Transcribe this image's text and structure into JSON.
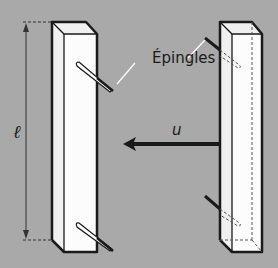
{
  "diagram": {
    "labels": {
      "pins": "Épingles",
      "length": "ℓ",
      "velocity": "u"
    },
    "elements": [
      {
        "name": "left-bar",
        "description": "rectangular bar with two pins stuck through its front face"
      },
      {
        "name": "right-bar",
        "description": "rectangular bar with two pins, hidden parts dashed"
      },
      {
        "name": "length-dimension",
        "description": "vertical double-headed dimension arrow along left bar"
      },
      {
        "name": "velocity-arrow",
        "description": "horizontal arrow pointing left from right bar"
      }
    ],
    "colors": {
      "background": "#a9a9a9",
      "bar_face": "#fafafa",
      "bar_side": "#f0f0f0",
      "stroke": "#1a1a1a"
    }
  }
}
